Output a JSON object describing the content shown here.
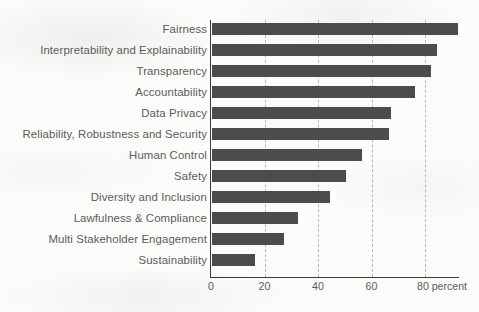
{
  "chart_data": {
    "type": "bar",
    "orientation": "horizontal",
    "title": "",
    "subtitle": "",
    "xlabel": "percent",
    "ylabel": "",
    "xlim": [
      0,
      92
    ],
    "xticks": [
      0,
      20,
      40,
      60,
      80
    ],
    "xtick_labels": [
      "0",
      "20",
      "40",
      "60",
      "80 percent"
    ],
    "unit_suffix": "percent",
    "grid": true,
    "grid_axis": "x",
    "grid_style": "dashed",
    "legend": false,
    "legend_position": "none",
    "bar_color": "#4c4c4c",
    "text_color": "#5b5b58",
    "axis_color": "#3b3b3b",
    "background_color": "#fbfbf9",
    "categories": [
      "Fairness",
      "Interpretability and Explainability",
      "Transparency",
      "Accountability",
      "Data Privacy",
      "Reliability, Robustness and Security",
      "Human Control",
      "Safety",
      "Diversity and Inclusion",
      "Lawfulness & Compliance",
      "Multi Stakeholder Engagement",
      "Sustainability"
    ],
    "values": [
      92,
      84,
      82,
      76,
      67,
      66,
      56,
      50,
      44,
      32,
      27,
      16
    ],
    "bars": [
      {
        "label": "Fairness",
        "value": 92
      },
      {
        "label": "Interpretability and Explainability",
        "value": 84
      },
      {
        "label": "Transparency",
        "value": 82
      },
      {
        "label": "Accountability",
        "value": 76
      },
      {
        "label": "Data Privacy",
        "value": 67
      },
      {
        "label": "Reliability, Robustness and Security",
        "value": 66
      },
      {
        "label": "Human Control",
        "value": 56
      },
      {
        "label": "Safety",
        "value": 50
      },
      {
        "label": "Diversity and Inclusion",
        "value": 44
      },
      {
        "label": "Lawfulness & Compliance",
        "value": 32
      },
      {
        "label": "Multi Stakeholder Engagement",
        "value": 27
      },
      {
        "label": "Sustainability",
        "value": 16
      }
    ]
  },
  "layout": {
    "origin_x_px": 211,
    "px_per_percent": 2.675,
    "first_bar_top_px": 23,
    "row_pitch_px": 21,
    "bar_height_px": 12,
    "baseline_y_px": 277
  }
}
